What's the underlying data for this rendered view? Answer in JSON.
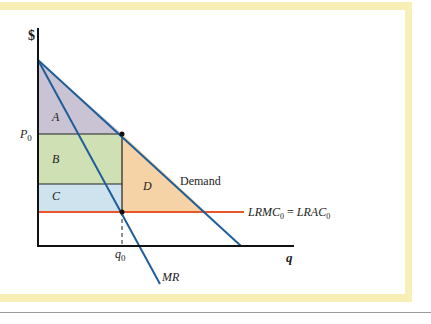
{
  "figure": {
    "axis_labels": {
      "y": "$",
      "x": "q"
    },
    "tick_labels": {
      "price": "P",
      "price_sub": "0",
      "quantity": "q",
      "quantity_sub": "0"
    },
    "regions": [
      {
        "id": "A",
        "label": "A",
        "color": "#c9c3d3"
      },
      {
        "id": "B",
        "label": "B",
        "color": "#cfe0b4"
      },
      {
        "id": "C",
        "label": "C",
        "color": "#cfe3ee"
      },
      {
        "id": "D",
        "label": "D",
        "color": "#f6d3a6"
      }
    ],
    "curves": {
      "demand": {
        "label": "Demand",
        "color": "#1f5e99"
      },
      "mr": {
        "label": "MR",
        "color": "#1f5e99"
      },
      "cost": {
        "label_left": "LRMC",
        "label_left_sub": "0",
        "equals": "=",
        "label_right": "LRAC",
        "label_right_sub": "0",
        "color": "#e8562a"
      }
    },
    "colors": {
      "frame": "#f8efb6",
      "axis": "#111111",
      "rule": "#9a9a9a"
    }
  }
}
